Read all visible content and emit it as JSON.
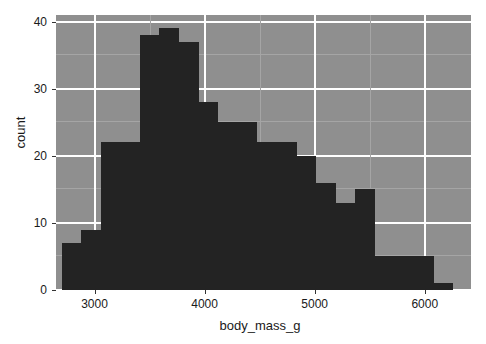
{
  "chart_data": {
    "type": "bar",
    "title": "",
    "subtitle": "",
    "xlabel": "body_mass_g",
    "ylabel": "count",
    "grid": true,
    "legend": null,
    "xlim": [
      2650,
      6420
    ],
    "ylim": [
      0,
      41
    ],
    "xticks": [
      3000,
      4000,
      5000,
      6000
    ],
    "xtick_labels": [
      "3000",
      "4000",
      "5000",
      "6000"
    ],
    "yticks": [
      0,
      10,
      20,
      30,
      40
    ],
    "ytick_labels": [
      "0",
      "10",
      "20",
      "30",
      "40"
    ],
    "bin_width": 178,
    "bar_color": "#232323",
    "panel_color": "#8f8f8f",
    "grid_color": "#ffffff",
    "bins": [
      {
        "left": 2700,
        "right": 2878,
        "count": 7
      },
      {
        "left": 2878,
        "right": 3056,
        "count": 9
      },
      {
        "left": 3056,
        "right": 3234,
        "count": 22
      },
      {
        "left": 3234,
        "right": 3412,
        "count": 22
      },
      {
        "left": 3412,
        "right": 3590,
        "count": 38
      },
      {
        "left": 3590,
        "right": 3768,
        "count": 39
      },
      {
        "left": 3768,
        "right": 3946,
        "count": 37
      },
      {
        "left": 3946,
        "right": 4124,
        "count": 28
      },
      {
        "left": 4124,
        "right": 4302,
        "count": 25
      },
      {
        "left": 4302,
        "right": 4480,
        "count": 25
      },
      {
        "left": 4480,
        "right": 4658,
        "count": 22
      },
      {
        "left": 4658,
        "right": 4836,
        "count": 22
      },
      {
        "left": 4836,
        "right": 5014,
        "count": 20
      },
      {
        "left": 5014,
        "right": 5192,
        "count": 16
      },
      {
        "left": 5192,
        "right": 5370,
        "count": 13
      },
      {
        "left": 5370,
        "right": 5548,
        "count": 15
      },
      {
        "left": 5548,
        "right": 5726,
        "count": 5
      },
      {
        "left": 5726,
        "right": 5904,
        "count": 5
      },
      {
        "left": 5904,
        "right": 6082,
        "count": 5
      },
      {
        "left": 6082,
        "right": 6260,
        "count": 1
      }
    ]
  }
}
